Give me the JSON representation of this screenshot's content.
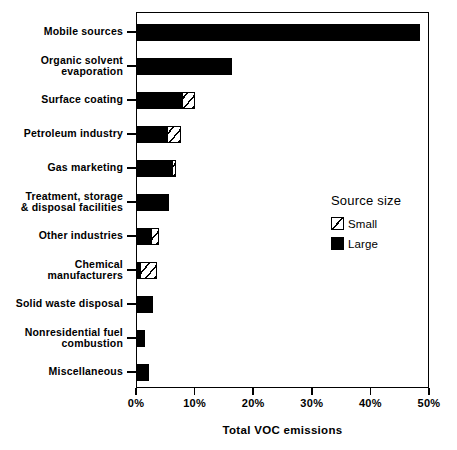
{
  "chart_data": {
    "type": "bar",
    "orientation": "horizontal",
    "stacked": true,
    "title": "",
    "xlabel": "Total VOC emissions",
    "ylabel": "",
    "xlim": [
      0,
      50
    ],
    "xticks": [
      "0%",
      "10%",
      "20%",
      "30%",
      "40%",
      "50%"
    ],
    "xtick_values": [
      0,
      10,
      20,
      30,
      40,
      50
    ],
    "grid": false,
    "legend": {
      "title": "Source size",
      "position": "inside-right",
      "entries": [
        {
          "name": "Small",
          "style": "hatched",
          "color": "#ffffff"
        },
        {
          "name": "Large",
          "style": "solid",
          "color": "#000000"
        }
      ]
    },
    "categories": [
      "Mobile sources",
      "Organic solvent\nevaporation",
      "Surface coating",
      "Petroleum industry",
      "Gas marketing",
      "Treatment, storage\n& disposal facilities",
      "Other industries",
      "Chemical\nmanufacturers",
      "Solid waste disposal",
      "Nonresidential fuel\ncombustion",
      "Miscellaneous"
    ],
    "series": [
      {
        "name": "Large",
        "values": [
          48.5,
          16.3,
          7.9,
          5.3,
          6.2,
          5.6,
          2.6,
          0.7,
          2.9,
          1.5,
          2.2
        ]
      },
      {
        "name": "Small",
        "values": [
          0.0,
          0.0,
          2.1,
          2.4,
          0.6,
          0.0,
          1.4,
          2.9,
          0.0,
          0.0,
          0.0
        ]
      }
    ],
    "totals": [
      48.5,
      16.3,
      10.0,
      7.7,
      6.8,
      5.6,
      4.0,
      3.6,
      2.9,
      1.5,
      2.2
    ]
  },
  "axis": {
    "x_title": "Total VOC emissions",
    "tick_labels": [
      "0%",
      "10%",
      "20%",
      "30%",
      "40%",
      "50%"
    ]
  },
  "legend": {
    "title": "Source size",
    "small_label": "Small",
    "large_label": "Large"
  },
  "caption": {
    "text": ""
  },
  "colors": {
    "large": "#000000",
    "small_fill": "#ffffff",
    "frame": "#000000",
    "background": "#ffffff"
  }
}
